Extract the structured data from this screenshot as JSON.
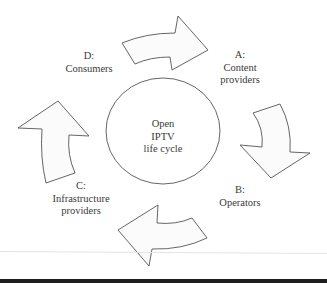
{
  "diagram": {
    "title_center": [
      "Open",
      "IPTV",
      "life cycle"
    ],
    "nodes": [
      {
        "id": "A",
        "label_lines": [
          "A:",
          "Content",
          "providers"
        ]
      },
      {
        "id": "B",
        "label_lines": [
          "B:",
          "Operators"
        ]
      },
      {
        "id": "C",
        "label_lines": [
          "C:",
          "Infrastructure",
          "providers"
        ]
      },
      {
        "id": "D",
        "label_lines": [
          "D:",
          "Consumers"
        ]
      }
    ],
    "edges": [
      {
        "from": "D",
        "to": "A",
        "shape": "curved-block-arrow"
      },
      {
        "from": "A",
        "to": "B",
        "shape": "curved-block-arrow"
      },
      {
        "from": "B",
        "to": "C",
        "shape": "curved-block-arrow"
      },
      {
        "from": "C",
        "to": "D",
        "shape": "curved-block-arrow"
      }
    ],
    "colors": {
      "stroke": "#555555",
      "arrow_fill": "#fbfbfb",
      "text": "#3a3a3a",
      "bottom_bar": "#1e1e1e"
    }
  }
}
